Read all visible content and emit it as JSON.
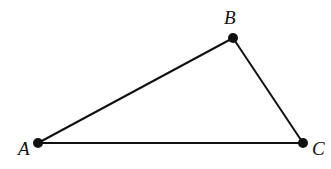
{
  "diagram": {
    "type": "triangle",
    "stroke_color": "#111111",
    "background": "#ffffff",
    "vertices": [
      {
        "id": "A",
        "label": "A",
        "x": 38,
        "y": 143,
        "label_x": 18,
        "label_y": 155
      },
      {
        "id": "B",
        "label": "B",
        "x": 233,
        "y": 38,
        "label_x": 224,
        "label_y": 24
      },
      {
        "id": "C",
        "label": "C",
        "x": 303,
        "y": 143,
        "label_x": 312,
        "label_y": 155
      }
    ],
    "edges": [
      {
        "from": "A",
        "to": "B"
      },
      {
        "from": "B",
        "to": "C"
      },
      {
        "from": "A",
        "to": "C"
      }
    ]
  }
}
